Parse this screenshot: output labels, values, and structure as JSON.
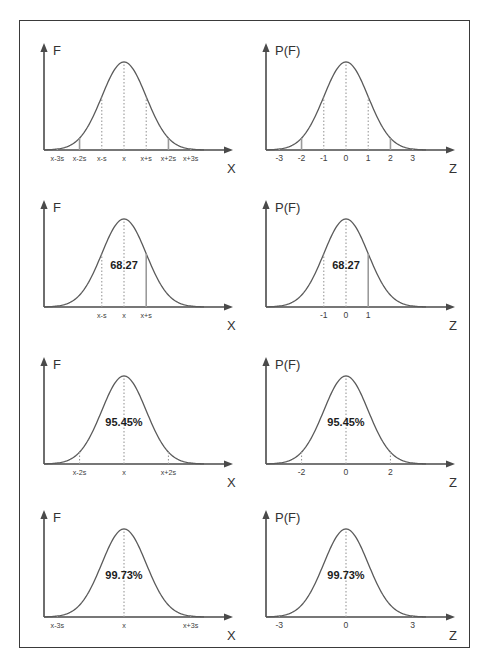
{
  "figure": {
    "frame_color": "#3a3a3a",
    "background": "#ffffff",
    "curve_color": "#5a5a5a",
    "axis_color": "#4a4a4a",
    "dropline_color": "#9a9a9a",
    "caption": ""
  },
  "chart_data": [
    {
      "type": "line",
      "id": "row1-left",
      "title": "",
      "ylabel": "F",
      "xlabel": "X",
      "grid": false,
      "legend": null,
      "distribution": "normal",
      "x": [
        -3,
        -2,
        -1,
        0,
        1,
        2,
        3
      ],
      "tick_labels": [
        "x-3s",
        "x-2s",
        "x-s",
        "x",
        "x+s",
        "x+2s",
        "x+3s"
      ],
      "droplines_at": [
        -3,
        -2,
        -1,
        0,
        1,
        2,
        3
      ],
      "annotations": [],
      "xlim": [
        -3.6,
        3.6
      ],
      "ylim": [
        0,
        1
      ]
    },
    {
      "type": "line",
      "id": "row1-right",
      "title": "",
      "ylabel": "P(F)",
      "xlabel": "Z",
      "grid": false,
      "legend": null,
      "distribution": "normal",
      "x": [
        -3,
        -2,
        -1,
        0,
        1,
        2,
        3
      ],
      "tick_labels": [
        "-3",
        "-2",
        "-1",
        "0",
        "1",
        "2",
        "3"
      ],
      "droplines_at": [
        -3,
        -2,
        -1,
        0,
        1,
        2,
        3
      ],
      "annotations": [],
      "xlim": [
        -3.6,
        3.6
      ],
      "ylim": [
        0,
        1
      ]
    },
    {
      "type": "line",
      "id": "row2-left",
      "title": "",
      "ylabel": "F",
      "xlabel": "X",
      "grid": false,
      "legend": null,
      "distribution": "normal",
      "x": [
        -1,
        0,
        1
      ],
      "tick_labels": [
        "x-s",
        "x",
        "x+s"
      ],
      "droplines_at": [
        -1,
        0,
        1
      ],
      "annotations": [
        {
          "text": "68.27",
          "x": 0,
          "y": 0.43
        }
      ],
      "xlim": [
        -3.6,
        3.6
      ],
      "ylim": [
        0,
        1
      ]
    },
    {
      "type": "line",
      "id": "row2-right",
      "title": "",
      "ylabel": "P(F)",
      "xlabel": "Z",
      "grid": false,
      "legend": null,
      "distribution": "normal",
      "x": [
        -1,
        0,
        1
      ],
      "tick_labels": [
        "-1",
        "0",
        "1"
      ],
      "droplines_at": [
        -1,
        0,
        1
      ],
      "annotations": [
        {
          "text": "68.27",
          "x": 0,
          "y": 0.43
        }
      ],
      "xlim": [
        -3.6,
        3.6
      ],
      "ylim": [
        0,
        1
      ]
    },
    {
      "type": "line",
      "id": "row3-left",
      "title": "",
      "ylabel": "F",
      "xlabel": "X",
      "grid": false,
      "legend": null,
      "distribution": "normal",
      "x": [
        -2,
        0,
        2
      ],
      "tick_labels": [
        "x-2s",
        "x",
        "x+2s"
      ],
      "droplines_at": [
        -2,
        0,
        2
      ],
      "annotations": [
        {
          "text": "95.45%",
          "x": 0,
          "y": 0.43
        }
      ],
      "xlim": [
        -3.6,
        3.6
      ],
      "ylim": [
        0,
        1
      ]
    },
    {
      "type": "line",
      "id": "row3-right",
      "title": "",
      "ylabel": "P(F)",
      "xlabel": "Z",
      "grid": false,
      "legend": null,
      "distribution": "normal",
      "x": [
        -2,
        0,
        2
      ],
      "tick_labels": [
        "-2",
        "0",
        "2"
      ],
      "droplines_at": [
        -2,
        0,
        2
      ],
      "annotations": [
        {
          "text": "95.45%",
          "x": 0,
          "y": 0.43
        }
      ],
      "xlim": [
        -3.6,
        3.6
      ],
      "ylim": [
        0,
        1
      ]
    },
    {
      "type": "line",
      "id": "row4-left",
      "title": "",
      "ylabel": "F",
      "xlabel": "X",
      "grid": false,
      "legend": null,
      "distribution": "normal",
      "x": [
        -3,
        0,
        3
      ],
      "tick_labels": [
        "x-3s",
        "x",
        "x+3s"
      ],
      "droplines_at": [
        -3,
        0,
        3
      ],
      "annotations": [
        {
          "text": "99.73%",
          "x": 0,
          "y": 0.43
        }
      ],
      "xlim": [
        -3.6,
        3.6
      ],
      "ylim": [
        0,
        1
      ]
    },
    {
      "type": "line",
      "id": "row4-right",
      "title": "",
      "ylabel": "P(F)",
      "xlabel": "Z",
      "grid": false,
      "legend": null,
      "distribution": "normal",
      "x": [
        -3,
        0,
        3
      ],
      "tick_labels": [
        "-3",
        "0",
        "3"
      ],
      "droplines_at": [
        -3,
        0,
        3
      ],
      "annotations": [
        {
          "text": "99.73%",
          "x": 0,
          "y": 0.43
        }
      ],
      "xlim": [
        -3.6,
        3.6
      ],
      "ylim": [
        0,
        1
      ]
    }
  ]
}
